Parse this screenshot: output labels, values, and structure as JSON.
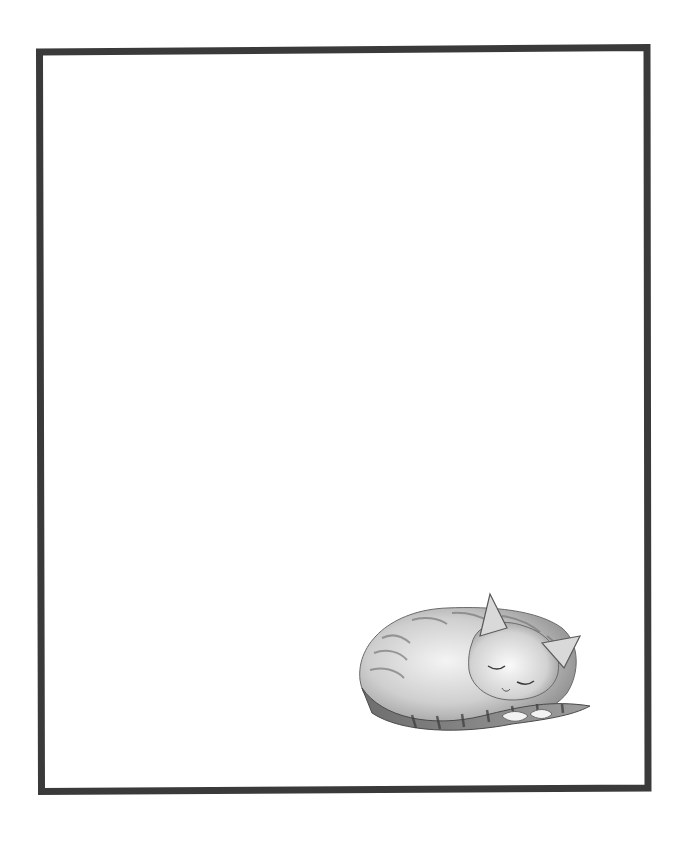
{
  "page": {
    "background": "#ffffff",
    "frame_color": "#3a3a3a"
  },
  "illustration": {
    "subject": "sleeping-tabby-cat",
    "style": "pencil-sketch",
    "colors": {
      "fur_dark": "#4a4a4a",
      "fur_mid": "#8a8a8a",
      "fur_light": "#c8c8c8",
      "paper": "#ffffff"
    }
  }
}
